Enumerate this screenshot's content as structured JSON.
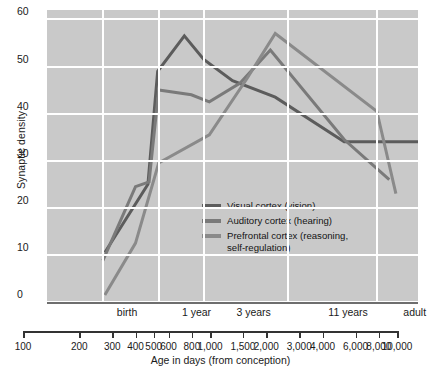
{
  "chart_data": {
    "type": "line",
    "title": "",
    "xlabel": "Age in days (from conception)",
    "ylabel": "Synaptic density",
    "x_scale": "log",
    "xlim": [
      100,
      10000
    ],
    "ylim": [
      0,
      62
    ],
    "grid": true,
    "legend_position": "inside-center",
    "y_ticks": [
      0,
      10,
      20,
      30,
      40,
      50,
      60
    ],
    "x_ticks": [
      100,
      200,
      300,
      400,
      500,
      600,
      800,
      1000,
      1500,
      2000,
      3000,
      4000,
      6000,
      8000,
      10000
    ],
    "x_tick_labels": [
      "100",
      "200",
      "300",
      "400",
      "500",
      "600",
      "800",
      "1,000",
      "1,500",
      "2,000",
      "3,000",
      "4,000",
      "6,000",
      "8,000",
      "10,000"
    ],
    "stage_labels": [
      {
        "label": "birth",
        "x": 270
      },
      {
        "label": "1 year",
        "x": 640
      },
      {
        "label": "3 years",
        "x": 1300
      },
      {
        "label": "11 years",
        "x": 4200
      },
      {
        "label": "adult",
        "x": 9600
      }
    ],
    "grid_x_values": [
      200,
      400,
      700,
      2000,
      6000
    ],
    "series": [
      {
        "name": "Visual cortex (vision)",
        "color": "#5c5c5c",
        "points": [
          {
            "x": 205,
            "y": 10.5
          },
          {
            "x": 350,
            "y": 25.0
          },
          {
            "x": 395,
            "y": 49.0
          },
          {
            "x": 550,
            "y": 56.5
          },
          {
            "x": 700,
            "y": 51.5
          },
          {
            "x": 1000,
            "y": 47.0
          },
          {
            "x": 1700,
            "y": 43.5
          },
          {
            "x": 4000,
            "y": 34.0
          },
          {
            "x": 10000,
            "y": 34.0
          }
        ]
      },
      {
        "name": "Auditory cortex (hearing)",
        "color": "#7a7a7a",
        "points": [
          {
            "x": 200,
            "y": 8.8
          },
          {
            "x": 300,
            "y": 24.5
          },
          {
            "x": 355,
            "y": 25.5
          },
          {
            "x": 400,
            "y": 45.0
          },
          {
            "x": 600,
            "y": 44.0
          },
          {
            "x": 750,
            "y": 42.5
          },
          {
            "x": 1100,
            "y": 46.5
          },
          {
            "x": 1600,
            "y": 53.5
          },
          {
            "x": 4000,
            "y": 34.5
          },
          {
            "x": 7000,
            "y": 26.0
          }
        ]
      },
      {
        "name": "Prefrontal cortex (reasoning,\nself-regulation)",
        "color": "#8a8a8a",
        "points": [
          {
            "x": 205,
            "y": 1.5
          },
          {
            "x": 300,
            "y": 12.5
          },
          {
            "x": 400,
            "y": 29.5
          },
          {
            "x": 750,
            "y": 35.5
          },
          {
            "x": 1200,
            "y": 47.5
          },
          {
            "x": 1700,
            "y": 57.0
          },
          {
            "x": 6000,
            "y": 40.5
          },
          {
            "x": 7600,
            "y": 23.0
          }
        ]
      }
    ]
  },
  "legend": {
    "items": [
      {
        "label": "Visual cortex (vision)",
        "color": "#5c5c5c"
      },
      {
        "label": "Auditory cortex (hearing)",
        "color": "#7a7a7a"
      },
      {
        "label": "Prefrontal cortex (reasoning,\nself-regulation)",
        "color": "#8a8a8a"
      }
    ]
  },
  "style": {
    "plot_background": "#c9c9c9",
    "gridline_color": "#ffffff",
    "axis_color": "#6e6e6e",
    "page_background": "#ffffff"
  }
}
